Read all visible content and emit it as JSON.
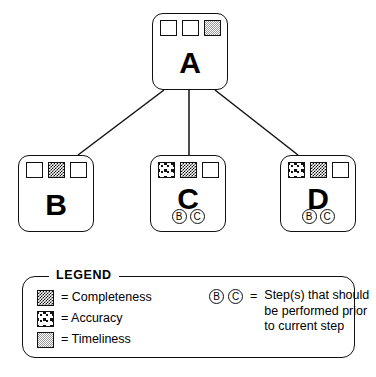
{
  "diagram": {
    "nodes": [
      {
        "id": "A",
        "label": "A",
        "swatches": [
          "empty",
          "empty",
          "timeliness"
        ],
        "prerequisites": []
      },
      {
        "id": "B",
        "label": "B",
        "swatches": [
          "empty",
          "completeness",
          "empty"
        ],
        "prerequisites": []
      },
      {
        "id": "C",
        "label": "C",
        "swatches": [
          "accuracy",
          "completeness",
          "empty"
        ],
        "prerequisites": [
          "B",
          "C"
        ]
      },
      {
        "id": "D",
        "label": "D",
        "swatches": [
          "accuracy",
          "completeness",
          "empty"
        ],
        "prerequisites": [
          "B",
          "C"
        ]
      }
    ],
    "edges": [
      {
        "from": "A",
        "to": "B"
      },
      {
        "from": "A",
        "to": "C"
      },
      {
        "from": "A",
        "to": "D"
      }
    ]
  },
  "legend": {
    "title": "LEGEND",
    "equals": "=",
    "patterns": [
      {
        "key": "completeness",
        "label": "= Completeness"
      },
      {
        "key": "accuracy",
        "label": "= Accuracy"
      },
      {
        "key": "timeliness",
        "label": "= Timeliness"
      }
    ],
    "prerequisite_key": {
      "symbols": [
        "B",
        "C"
      ],
      "equals": "=",
      "description_lines": [
        "Step(s) that should",
        "be performed prior",
        "to current step"
      ]
    }
  },
  "colors": {
    "stroke": "#111111",
    "background": "#ffffff",
    "timeliness_gray": "#9a9a9a"
  }
}
